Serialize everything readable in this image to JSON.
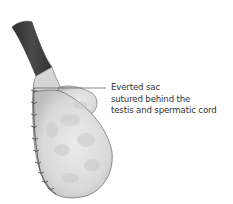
{
  "figure": {
    "annotation": {
      "lines": [
        "Everted sac",
        "sutured behind the",
        "testis and spermatic cord"
      ]
    },
    "colors": {
      "cord": "#3f3f3f",
      "tissue": "#e4e4e4",
      "tissue_shadow": "#b8b8b8",
      "outline": "#555555",
      "sutures": "#444444",
      "leader_line": "#555555",
      "text": "#333333"
    }
  }
}
